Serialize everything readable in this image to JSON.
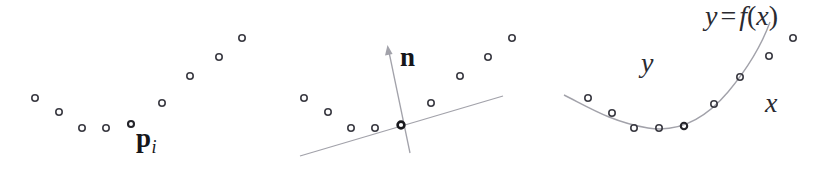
{
  "figure": {
    "width": 837,
    "height": 170,
    "background": "#ffffff",
    "marker_color": "#3a3a42",
    "curve_color": "#9a9aa2",
    "text_color": "#16161a",
    "marker_radius": 3.2,
    "marker_stroke_width": 1.6
  },
  "panels": [
    {
      "id": "panel-points",
      "name": "scattered-points-panel",
      "points": [
        {
          "x": 35,
          "y": 98
        },
        {
          "x": 59,
          "y": 112
        },
        {
          "x": 82,
          "y": 128
        },
        {
          "x": 106,
          "y": 128
        },
        {
          "x": 131,
          "y": 124
        },
        {
          "x": 162,
          "y": 103
        },
        {
          "x": 190,
          "y": 76
        },
        {
          "x": 219,
          "y": 57
        },
        {
          "x": 242,
          "y": 38
        }
      ],
      "highlight_index": 4,
      "labels": [
        {
          "name": "point-label-pi",
          "symbol": "p",
          "subscript": "i",
          "x": 136,
          "y": 125,
          "style": "bold-serif-with-italic-subscript"
        }
      ]
    },
    {
      "id": "panel-normal",
      "name": "tangent-normal-panel",
      "points": [
        {
          "x": 304,
          "y": 98
        },
        {
          "x": 328,
          "y": 112
        },
        {
          "x": 351,
          "y": 128
        },
        {
          "x": 375,
          "y": 128
        },
        {
          "x": 401,
          "y": 125
        },
        {
          "x": 431,
          "y": 103
        },
        {
          "x": 460,
          "y": 76
        },
        {
          "x": 488,
          "y": 57
        },
        {
          "x": 512,
          "y": 38
        }
      ],
      "highlight_index": 4,
      "tangent_line": {
        "name": "tangent-line",
        "x1": 300,
        "y1": 156,
        "x2": 503,
        "y2": 96
      },
      "normal_vector": {
        "name": "normal-vector-arrow",
        "x1": 410,
        "y1": 153,
        "x2": 388,
        "y2": 48,
        "arrowhead": true
      },
      "labels": [
        {
          "name": "normal-vector-label",
          "symbol": "n",
          "x": 400,
          "y": 44,
          "style": "bold-serif"
        }
      ]
    },
    {
      "id": "panel-fitted-curve",
      "name": "fitted-curve-panel",
      "points": [
        {
          "x": 588,
          "y": 98
        },
        {
          "x": 612,
          "y": 113
        },
        {
          "x": 634,
          "y": 128
        },
        {
          "x": 659,
          "y": 128
        },
        {
          "x": 684,
          "y": 126
        },
        {
          "x": 714,
          "y": 104
        },
        {
          "x": 740,
          "y": 77
        },
        {
          "x": 769,
          "y": 56
        },
        {
          "x": 793,
          "y": 38
        }
      ],
      "highlight_index": 4,
      "curve": {
        "name": "fitted-function-curve",
        "description": "smooth parabola fitted through the points",
        "path": "M 564,95 C 590,108 612,122 648,128 C 680,133 706,118 728,92 C 748,68 762,44 770,22"
      },
      "labels": [
        {
          "name": "axis-label-y",
          "symbol": "y",
          "x": 641,
          "y": 49,
          "style": "italic-serif"
        },
        {
          "name": "axis-label-x",
          "symbol": "x",
          "x": 765,
          "y": 89,
          "style": "italic-serif"
        },
        {
          "name": "function-equation-label",
          "lhs": "y",
          "operator": "=",
          "fn": "f",
          "open_paren": "(",
          "arg": "x",
          "close_paren": ")",
          "x": 705,
          "y": 2,
          "style": "italic-serif"
        }
      ]
    }
  ]
}
